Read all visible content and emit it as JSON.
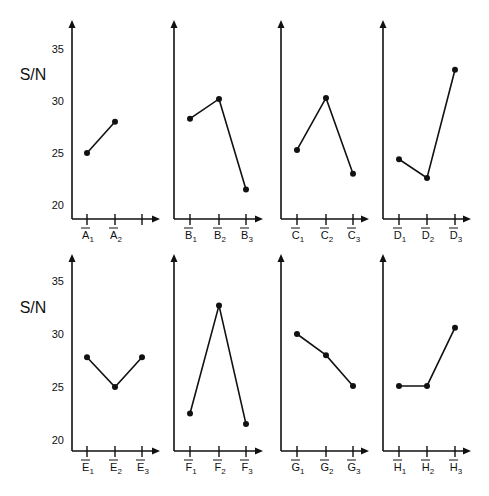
{
  "chart_data": {
    "type": "line",
    "ylabel": "S/N",
    "yticks": [
      20,
      25,
      30,
      35
    ],
    "ylim": [
      19,
      37
    ],
    "grid": false,
    "legend": null,
    "panels": [
      {
        "factor": "A",
        "row": 0,
        "categories": [
          "A1",
          "A2"
        ],
        "extra_empty_ticks": 1,
        "values": [
          25.0,
          28.0
        ]
      },
      {
        "factor": "B",
        "row": 0,
        "categories": [
          "B1",
          "B2",
          "B3"
        ],
        "values": [
          28.3,
          30.2,
          21.5
        ]
      },
      {
        "factor": "C",
        "row": 0,
        "categories": [
          "C1",
          "C2",
          "C3"
        ],
        "values": [
          25.3,
          30.3,
          23.0
        ]
      },
      {
        "factor": "D",
        "row": 0,
        "categories": [
          "D1",
          "D2",
          "D3"
        ],
        "values": [
          24.4,
          22.6,
          33.0
        ]
      },
      {
        "factor": "E",
        "row": 1,
        "categories": [
          "E1",
          "E2",
          "E3"
        ],
        "values": [
          27.8,
          25.0,
          27.8
        ]
      },
      {
        "factor": "F",
        "row": 1,
        "categories": [
          "F1",
          "F2",
          "F3"
        ],
        "values": [
          22.5,
          32.7,
          21.5
        ]
      },
      {
        "factor": "G",
        "row": 1,
        "categories": [
          "G1",
          "G2",
          "G3"
        ],
        "values": [
          30.0,
          28.0,
          25.1
        ]
      },
      {
        "factor": "H",
        "row": 1,
        "categories": [
          "H1",
          "H2",
          "H3"
        ],
        "values": [
          25.1,
          25.1,
          30.6
        ]
      }
    ]
  }
}
